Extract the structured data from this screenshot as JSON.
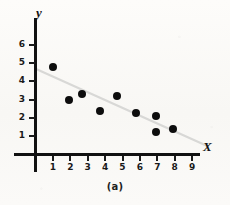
{
  "figure": {
    "caption": "(a)",
    "x_axis_title": "X",
    "y_axis_title": "y"
  },
  "chart_data": {
    "type": "scatter",
    "title": "",
    "subtitle": "",
    "caption": "(a)",
    "xlabel": "X",
    "ylabel": "y",
    "xlim": [
      0,
      9.6
    ],
    "ylim": [
      0,
      6.6
    ],
    "xticks": [
      1,
      2,
      3,
      4,
      5,
      6,
      7,
      8,
      9
    ],
    "yticks": [
      1,
      2,
      3,
      4,
      5,
      6
    ],
    "xtick_labels": [
      "1",
      "2",
      "3",
      "4",
      "5",
      "6",
      "7",
      "8",
      "9"
    ],
    "ytick_labels": [
      "1",
      "2",
      "3",
      "4",
      "5",
      "6"
    ],
    "grid": false,
    "legend": false,
    "legend_position": "none",
    "annotations": [],
    "marker_color": "#0d0d0d",
    "marker_shape": "filled-circle",
    "axis_color": "#111111",
    "background_color": "#fbfaf8",
    "series": [
      {
        "name": "observations",
        "x": [
          1.0,
          1.9,
          2.7,
          3.7,
          4.7,
          5.8,
          6.9,
          6.9,
          7.9
        ],
        "y": [
          4.8,
          3.0,
          3.3,
          2.35,
          3.2,
          2.25,
          2.1,
          1.25,
          1.4
        ]
      },
      {
        "name": "trend-line",
        "type": "line",
        "color": "#d8d8d6",
        "x": [
          0.1,
          9.9
        ],
        "y": [
          4.65,
          0.45
        ]
      }
    ],
    "relationship": "negative"
  }
}
